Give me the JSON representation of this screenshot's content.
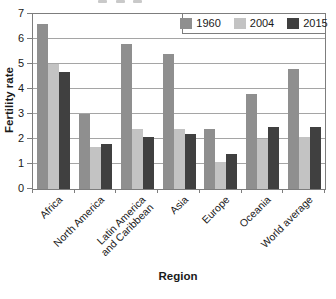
{
  "chart_data": {
    "type": "bar",
    "title": "",
    "xlabel": "Region",
    "ylabel": "Fertility rate",
    "ylim": [
      0,
      7
    ],
    "yticks": [
      0,
      1,
      2,
      3,
      4,
      5,
      6,
      7
    ],
    "grid": true,
    "legend_position": "top-right-inside",
    "categories": [
      "Africa",
      "North America",
      "Latin America\nand Caribbean",
      "Asia",
      "Europe",
      "Oceania",
      "World average"
    ],
    "series": [
      {
        "name": "1960",
        "color": "#8f8f8f",
        "values": [
          6.6,
          3.0,
          5.8,
          5.4,
          2.4,
          3.8,
          4.8
        ]
      },
      {
        "name": "2004",
        "color": "#c3c3c3",
        "values": [
          5.0,
          1.7,
          2.4,
          2.4,
          1.1,
          2.0,
          2.1
        ]
      },
      {
        "name": "2015",
        "color": "#404040",
        "values": [
          4.7,
          1.8,
          2.1,
          2.2,
          1.4,
          2.5,
          2.5
        ]
      }
    ]
  },
  "colors": {
    "axis": "#7d7d7d",
    "grid": "#a5a5a5",
    "text": "#1a1a1a",
    "background": "#ffffff"
  }
}
